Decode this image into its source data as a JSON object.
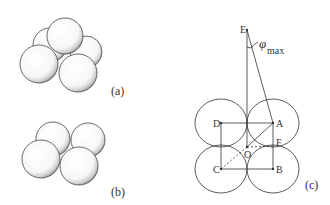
{
  "figure": {
    "panels": [
      {
        "id": "a",
        "label": "(a)",
        "description": "five spheres stacked in pyramid"
      },
      {
        "id": "b",
        "label": "(b)",
        "description": "four spheres in square layer"
      },
      {
        "id": "c",
        "label": "(c)",
        "description": "geometry of square packing with apex angle"
      }
    ],
    "points": {
      "E": "E",
      "D": "D",
      "A": "A",
      "C": "C",
      "B": "B",
      "O": "O",
      "F": "F"
    },
    "angle": {
      "symbol": "φ",
      "subscript": "max"
    }
  }
}
